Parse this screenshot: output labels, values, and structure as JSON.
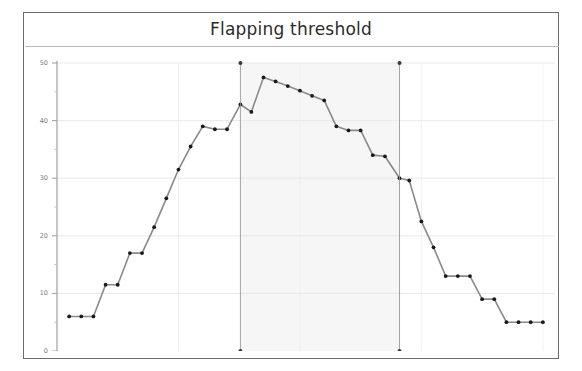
{
  "chart_data": {
    "type": "line",
    "title": "Flapping threshold",
    "xlabel": "",
    "ylabel": "",
    "xlim": [
      0,
      41
    ],
    "ylim": [
      0,
      50
    ],
    "grid": true,
    "legend": null,
    "x_ticks": [
      10,
      20,
      30,
      40
    ],
    "x_minor_ticks": [
      5,
      15,
      25,
      35
    ],
    "y_ticks": [
      0,
      10,
      20,
      30,
      40,
      50
    ],
    "y_minor_ticks": [
      5,
      15,
      25,
      35,
      45
    ],
    "line_color": "#8a8a8a",
    "marker_color": "#1a1a1a",
    "shaded_region": {
      "x_start": 15.1,
      "x_end": 28.2,
      "fill_color": "#f6f6f6",
      "edge_color": "#9a9a9a",
      "endpoint_marker_color": "#3a3a3a",
      "y_bottom": 0,
      "y_top": 50
    },
    "series": [
      {
        "name": "threshold",
        "x": [
          1.0,
          2.0,
          3.0,
          4.0,
          5.0,
          6.0,
          7.0,
          8.0,
          9.0,
          10.0,
          11.0,
          12.0,
          13.0,
          14.0,
          15.1,
          16.0,
          17.0,
          18.0,
          19.0,
          20.0,
          21.0,
          22.0,
          23.0,
          24.0,
          25.0,
          26.0,
          27.0,
          28.2,
          29.0,
          30.0,
          31.0,
          32.0,
          33.0,
          34.0,
          35.0,
          36.0,
          37.0,
          38.0,
          39.0,
          40.0
        ],
        "y": [
          6.0,
          6.0,
          6.0,
          11.5,
          11.5,
          17.0,
          17.0,
          21.5,
          26.5,
          31.5,
          35.5,
          39.0,
          38.5,
          38.5,
          42.8,
          41.5,
          47.5,
          46.8,
          46.0,
          45.2,
          44.3,
          43.5,
          39.0,
          38.3,
          38.3,
          34.0,
          33.8,
          30.0,
          29.6,
          22.5,
          18.0,
          13.0,
          13.0,
          13.0,
          9.0,
          9.0,
          5.0,
          5.0,
          5.0,
          5.0
        ]
      }
    ]
  }
}
